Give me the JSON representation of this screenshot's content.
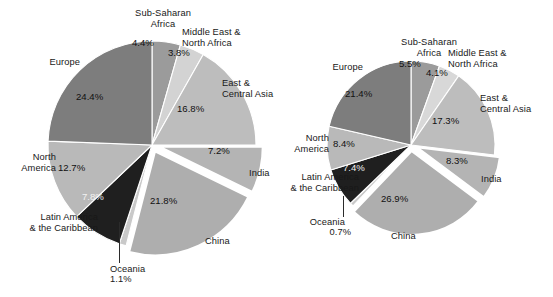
{
  "figure": {
    "background": "#ffffff",
    "chart_count": 2
  },
  "chart_data": [
    {
      "id": "pie-left",
      "type": "pie",
      "title": "",
      "units": "percent",
      "legend": "none",
      "labels_position": "callout-outside",
      "categories": [
        "Sub-Saharan Africa",
        "Middle East & North Africa",
        "East & Central Asia",
        "India",
        "China",
        "Oceania",
        "Latin America & the Caribbean",
        "North America",
        "Europe"
      ],
      "values": [
        4.4,
        3.8,
        16.8,
        7.2,
        21.8,
        1.1,
        7.8,
        12.7,
        24.4
      ],
      "value_labels": [
        "4.4%",
        "3.8%",
        "16.8%",
        "7.2%",
        "21.8%",
        "1.1%",
        "7.8%",
        "12.7%",
        "24.4%"
      ],
      "colors": [
        "#9b9b9b",
        "#d3d3d3",
        "#bdbdbd",
        "#b4b4b4",
        "#aeaeae",
        "#c9c9c9",
        "#1f1f1f",
        "#b9b9b9",
        "#7d7d7d"
      ],
      "exploded_slices": [
        "India",
        "China"
      ],
      "slice_border": "#ffffff"
    },
    {
      "id": "pie-right",
      "type": "pie",
      "title": "",
      "units": "percent",
      "legend": "none",
      "labels_position": "callout-outside",
      "categories": [
        "Sub-Saharan Africa",
        "Middle East & North Africa",
        "East & Central Asia",
        "India",
        "China",
        "Oceania",
        "Latin America & the Caribbean",
        "North America",
        "Europe"
      ],
      "values": [
        5.5,
        4.1,
        17.3,
        8.3,
        26.9,
        0.7,
        7.4,
        8.4,
        21.4
      ],
      "value_labels": [
        "5.5%",
        "4.1%",
        "17.3%",
        "8.3%",
        "26.9%",
        "0.7%",
        "7.4%",
        "8.4%",
        "21.4%"
      ],
      "colors": [
        "#9b9b9b",
        "#d8d8d8",
        "#bdbdbd",
        "#b4b4b4",
        "#aeaeae",
        "#c9c9c9",
        "#1f1f1f",
        "#b9b9b9",
        "#7d7d7d"
      ],
      "exploded_slices": [
        "India",
        "China"
      ],
      "slice_border": "#ffffff"
    }
  ],
  "left_chart": {
    "labels": {
      "sub_saharan_africa": "Sub-Saharan\nAfrica",
      "middle_east_north_africa": "Middle East &\nNorth Africa",
      "east_central_asia": "East &\nCentral Asia",
      "india": "India",
      "china": "China",
      "oceania": "Oceania",
      "latin_america": "Latin America\n& the Caribbean",
      "north_america": "North\nAmerica",
      "europe": "Europe"
    },
    "percents": {
      "sub_saharan_africa": "4.4%",
      "middle_east_north_africa": "3.8%",
      "east_central_asia": "16.8%",
      "india": "7.2%",
      "china": "21.8%",
      "oceania": "1.1%",
      "latin_america": "7.8%",
      "north_america": "12.7%",
      "europe": "24.4%"
    }
  },
  "right_chart": {
    "labels": {
      "sub_saharan_africa": "Sub-Saharan\nAfrica",
      "middle_east_north_africa": "Middle East &\nNorth Africa",
      "east_central_asia": "East &\nCentral Asia",
      "india": "India",
      "china": "China",
      "oceania": "Oceania",
      "latin_america": "Latin America\n& the Caribbean",
      "north_america": "North\nAmerica",
      "europe": "Europe"
    },
    "percents": {
      "sub_saharan_africa": "5.5%",
      "middle_east_north_africa": "4.1%",
      "east_central_asia": "17.3%",
      "india": "8.3%",
      "china": "26.9%",
      "oceania": "0.7%",
      "latin_america": "7.4%",
      "north_america": "8.4%",
      "europe": "21.4%"
    }
  }
}
